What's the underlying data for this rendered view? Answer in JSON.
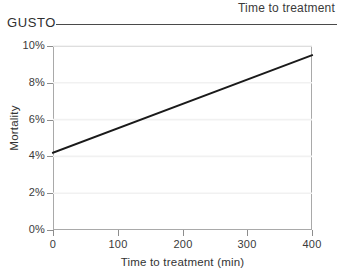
{
  "header": {
    "study_label": "GUSTO",
    "section_title": "Time to treatment",
    "rule_color": "#4a4a4a"
  },
  "chart_data": {
    "type": "line",
    "title": "",
    "xlabel": "Time to treatment (min)",
    "ylabel": "Mortality",
    "xlim": [
      0,
      400
    ],
    "ylim": [
      0,
      10
    ],
    "xticks": [
      0,
      100,
      200,
      300,
      400
    ],
    "xtick_labels": [
      "0",
      "100",
      "200",
      "300",
      "400"
    ],
    "yticks": [
      0,
      2,
      4,
      6,
      8,
      10
    ],
    "ytick_labels": [
      "0%",
      "2%",
      "4%",
      "6%",
      "8%",
      "10%"
    ],
    "grid": true,
    "legend": false,
    "line_color": "#1a1a1a",
    "series": [
      {
        "name": "Mortality",
        "x": [
          0,
          400
        ],
        "values": [
          4.2,
          9.5
        ]
      }
    ]
  }
}
